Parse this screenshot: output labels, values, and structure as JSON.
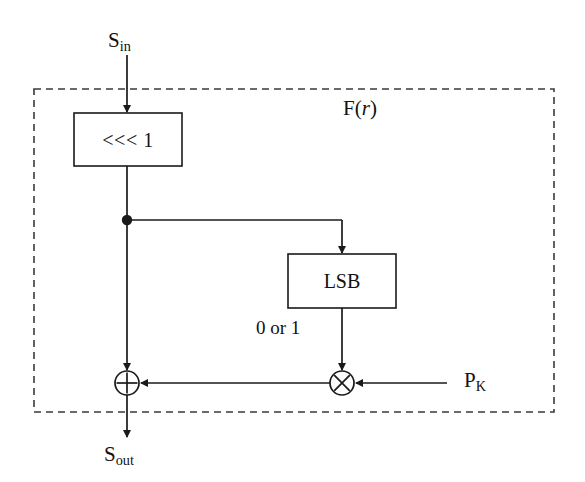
{
  "diagram": {
    "container_label": "F(",
    "container_label_italic": "r",
    "container_label_tail": ")",
    "colors": {
      "line": "#1a1a1a",
      "background": "#ffffff",
      "dashed_border": "#3a3a3a"
    },
    "signals": {
      "input": {
        "base": "S",
        "sub": "in"
      },
      "output": {
        "base": "S",
        "sub": "out"
      },
      "key": {
        "base": "P",
        "sub": "K"
      }
    },
    "blocks": [
      {
        "id": "rotate",
        "label": "<<< 1",
        "x": 74,
        "y": 113,
        "w": 108,
        "h": 53
      },
      {
        "id": "lsb",
        "label": "LSB",
        "x": 288,
        "y": 254,
        "w": 108,
        "h": 54
      }
    ],
    "operators": [
      {
        "id": "xor",
        "glyph": "circle-plus",
        "cx": 127,
        "cy": 383,
        "r": 12
      },
      {
        "id": "multiply",
        "glyph": "circle-times",
        "cx": 342,
        "cy": 383,
        "r": 12
      }
    ],
    "junction": {
      "id": "tap",
      "cx": 127,
      "cy": 220,
      "r": 5
    },
    "wire_labels": [
      {
        "id": "lsb-output",
        "text": "0 or 1"
      }
    ],
    "dashed_boundary": {
      "x": 34,
      "y": 89,
      "w": 520,
      "h": 323
    }
  }
}
